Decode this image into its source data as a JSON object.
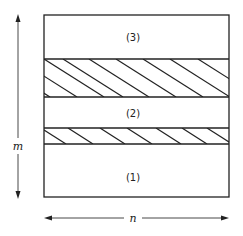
{
  "figure": {
    "type": "layered-rectangle",
    "regions": [
      {
        "id": "region-3",
        "label": "(3)",
        "fill": "plain"
      },
      {
        "id": "hatched-band-upper",
        "label": "",
        "fill": "diagonal-hatch"
      },
      {
        "id": "region-2",
        "label": "(2)",
        "fill": "plain"
      },
      {
        "id": "hatched-band-lower",
        "label": "",
        "fill": "diagonal-hatch"
      },
      {
        "id": "region-1",
        "label": "(1)",
        "fill": "plain"
      }
    ],
    "dimensions": {
      "vertical": {
        "label": "m",
        "direction": "double-arrow"
      },
      "horizontal": {
        "label": "n",
        "direction": "double-arrow"
      }
    },
    "colors": {
      "stroke": "#222222",
      "background": "#ffffff"
    }
  }
}
